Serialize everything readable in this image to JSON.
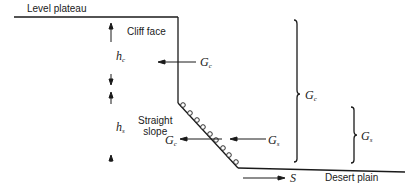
{
  "diagram": {
    "labels": {
      "level_plateau": "Level plateau",
      "cliff_face": "Cliff face",
      "straight_slope_line1": "Straight",
      "straight_slope_line2": "slope",
      "desert_plain": "Desert plain"
    },
    "symbols": {
      "h_c": {
        "base": "h",
        "sub": "c"
      },
      "h_s": {
        "base": "h",
        "sub": "s"
      },
      "G_c_cliff": {
        "base": "G",
        "sub": "c"
      },
      "G_c_slope": {
        "base": "G",
        "sub": "c"
      },
      "G_s_slope": {
        "base": "G",
        "sub": "s"
      },
      "G_c_brace": {
        "base": "G",
        "sub": "c"
      },
      "G_s_brace": {
        "base": "G",
        "sub": "s"
      },
      "S": "S"
    },
    "colors": {
      "line": "#1a1a1a",
      "background": "#ffffff"
    }
  }
}
